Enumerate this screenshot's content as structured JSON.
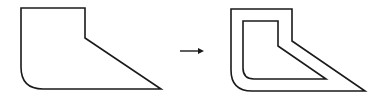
{
  "diagram": {
    "stroke_color": "#1a1a1a",
    "background": "#ffffff",
    "source_shape": {
      "label": "",
      "path": "M21,8 L85,8 L85,38 L161,89 L43,89 Q21,89 21,67 Z"
    },
    "arrow": {
      "label": "",
      "x1": 180,
      "y1": 51,
      "x2": 204,
      "y2": 51
    },
    "result_shape": {
      "label": "",
      "outer_path": "M231,9 L292,9 L292,41 L365,91 L252,91 Q231,91 231,70 Z",
      "inner_path": "M243,21 L278,21 L278,46 L326,79 L254,79 Q243,79 243,68 Z"
    }
  }
}
